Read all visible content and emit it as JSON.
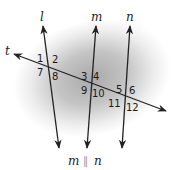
{
  "diagram": {
    "type": "parallel-lines-transversal",
    "lines": {
      "l": {
        "label": "l",
        "x1": 43,
        "y1": 26,
        "x2": 59,
        "y2": 148
      },
      "m": {
        "label": "m",
        "x1": 96,
        "y1": 26,
        "x2": 87,
        "y2": 148
      },
      "n": {
        "label": "n",
        "x1": 130,
        "y1": 26,
        "x2": 122,
        "y2": 148
      },
      "t": {
        "label": "t",
        "x1": 14,
        "y1": 54,
        "x2": 166,
        "y2": 111
      }
    },
    "angle_labels": [
      {
        "id": "1",
        "text": "1",
        "x": 37,
        "y": 62
      },
      {
        "id": "2",
        "text": "2",
        "x": 52,
        "y": 63
      },
      {
        "id": "7",
        "text": "7",
        "x": 37,
        "y": 76
      },
      {
        "id": "8",
        "text": "8",
        "x": 52,
        "y": 80
      },
      {
        "id": "3",
        "text": "3",
        "x": 81,
        "y": 80
      },
      {
        "id": "4",
        "text": "4",
        "x": 93,
        "y": 80
      },
      {
        "id": "9",
        "text": "9",
        "x": 81,
        "y": 94
      },
      {
        "id": "10",
        "text": "10",
        "x": 92,
        "y": 97
      },
      {
        "id": "5",
        "text": "5",
        "x": 116,
        "y": 93
      },
      {
        "id": "6",
        "text": "6",
        "x": 129,
        "y": 94
      },
      {
        "id": "11",
        "text": "11",
        "x": 108,
        "y": 107
      },
      {
        "id": "12",
        "text": "12",
        "x": 126,
        "y": 111
      }
    ],
    "caption": {
      "left": "m",
      "symbol": "∥",
      "right": "n"
    },
    "colors": {
      "line": "#222222",
      "background_shade": "#b8b8b8",
      "background": "#ffffff"
    }
  }
}
